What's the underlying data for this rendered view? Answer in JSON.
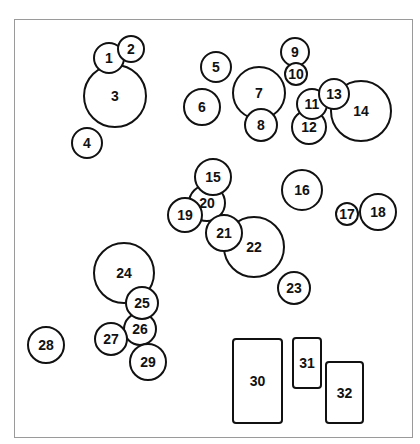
{
  "diagram": {
    "title": "",
    "colors": {
      "stroke": "#111111",
      "frame": "#9a9a9a",
      "background": "#ffffff"
    },
    "circles": [
      {
        "label": "3",
        "cx": 115,
        "cy": 96,
        "r": 31
      },
      {
        "label": "1",
        "cx": 109,
        "cy": 58,
        "r": 15
      },
      {
        "label": "2",
        "cx": 131,
        "cy": 49,
        "r": 13
      },
      {
        "label": "4",
        "cx": 87,
        "cy": 143,
        "r": 15
      },
      {
        "label": "5",
        "cx": 216,
        "cy": 67,
        "r": 15
      },
      {
        "label": "6",
        "cx": 202,
        "cy": 107,
        "r": 18
      },
      {
        "label": "7",
        "cx": 259,
        "cy": 93,
        "r": 26
      },
      {
        "label": "8",
        "cx": 261,
        "cy": 125,
        "r": 16
      },
      {
        "label": "9",
        "cx": 295,
        "cy": 52,
        "r": 14
      },
      {
        "label": "14",
        "cx": 361,
        "cy": 111,
        "r": 30
      },
      {
        "label": "12",
        "cx": 309,
        "cy": 127,
        "r": 17
      },
      {
        "label": "10",
        "cx": 296,
        "cy": 74,
        "r": 11
      },
      {
        "label": "11",
        "cx": 312,
        "cy": 104,
        "r": 15
      },
      {
        "label": "13",
        "cx": 334,
        "cy": 94,
        "r": 15
      },
      {
        "label": "16",
        "cx": 302,
        "cy": 190,
        "r": 20
      },
      {
        "label": "17",
        "cx": 347,
        "cy": 214,
        "r": 11
      },
      {
        "label": "18",
        "cx": 378,
        "cy": 212,
        "r": 18
      },
      {
        "label": "22",
        "cx": 254,
        "cy": 247,
        "r": 30
      },
      {
        "label": "20",
        "cx": 207,
        "cy": 203,
        "r": 18
      },
      {
        "label": "15",
        "cx": 213,
        "cy": 177,
        "r": 18
      },
      {
        "label": "19",
        "cx": 185,
        "cy": 215,
        "r": 17
      },
      {
        "label": "21",
        "cx": 224,
        "cy": 233,
        "r": 18
      },
      {
        "label": "23",
        "cx": 294,
        "cy": 288,
        "r": 16
      },
      {
        "label": "24",
        "cx": 124,
        "cy": 273,
        "r": 30
      },
      {
        "label": "26",
        "cx": 140,
        "cy": 329,
        "r": 16
      },
      {
        "label": "25",
        "cx": 142,
        "cy": 303,
        "r": 16
      },
      {
        "label": "27",
        "cx": 111,
        "cy": 339,
        "r": 16
      },
      {
        "label": "29",
        "cx": 148,
        "cy": 362,
        "r": 18
      },
      {
        "label": "28",
        "cx": 46,
        "cy": 345,
        "r": 18
      }
    ],
    "rectangles": [
      {
        "label": "30",
        "x": 233,
        "y": 339,
        "w": 49,
        "h": 84
      },
      {
        "label": "31",
        "x": 293,
        "y": 338,
        "w": 28,
        "h": 50
      },
      {
        "label": "32",
        "x": 326,
        "y": 362,
        "w": 37,
        "h": 61
      }
    ]
  }
}
